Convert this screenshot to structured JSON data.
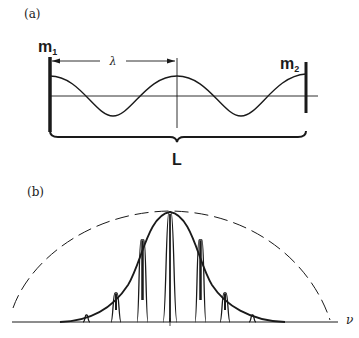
{
  "panel_a": {
    "label": "(a)",
    "mirror_left": {
      "label": "m",
      "subscript": "1"
    },
    "mirror_right": {
      "label": "m",
      "subscript": "2"
    },
    "wavelength_label": "λ",
    "cavity_length_label": "L"
  },
  "panel_b": {
    "label": "(b)",
    "axis_label": "ν",
    "curves": [
      "gain envelope (solid)",
      "cavity modes (spikes)",
      "dashed outer envelope"
    ]
  },
  "colors": {
    "ink": "#1a1a1a",
    "background": "#ffffff"
  }
}
